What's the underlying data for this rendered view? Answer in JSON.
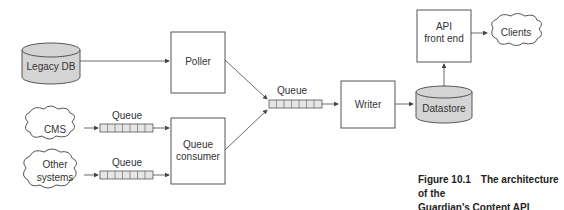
{
  "nodes": {
    "legacy_db": "Legacy DB",
    "poller": "Poller",
    "cms": "CMS",
    "other_systems_1": "Other",
    "other_systems_2": "systems",
    "queue_consumer_1": "Queue",
    "queue_consumer_2": "consumer",
    "writer": "Writer",
    "datastore": "Datastore",
    "api_front_end_1": "API",
    "api_front_end_2": "front end",
    "clients": "Clients"
  },
  "queues": {
    "cms_queue": "Queue",
    "other_queue": "Queue",
    "main_queue": "Queue"
  },
  "caption": {
    "number": "Figure 10.1",
    "text_line1": "The architecture of the",
    "text_line2": "Guardian's Content API"
  },
  "colors": {
    "cylinder_fill": "#d4d4d4",
    "stroke": "#555555",
    "queue_fill": "#e6e6e6"
  }
}
